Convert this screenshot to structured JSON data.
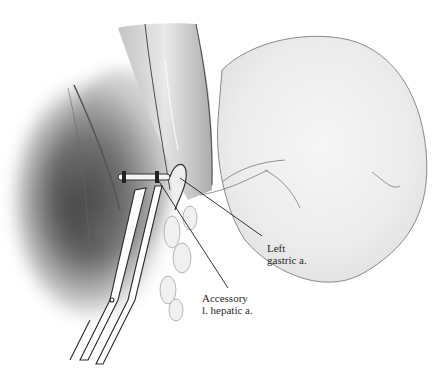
{
  "figure": {
    "labels": [
      {
        "line1": "Left",
        "line2": "gastric a."
      },
      {
        "line1": "Accessory",
        "line2": "l. hepatic a."
      }
    ]
  },
  "colors": {
    "background": "#ffffff",
    "line": "#1e1e1e",
    "shade_dark": "#3a3a3a",
    "shade_light": "#d8d8d8"
  }
}
